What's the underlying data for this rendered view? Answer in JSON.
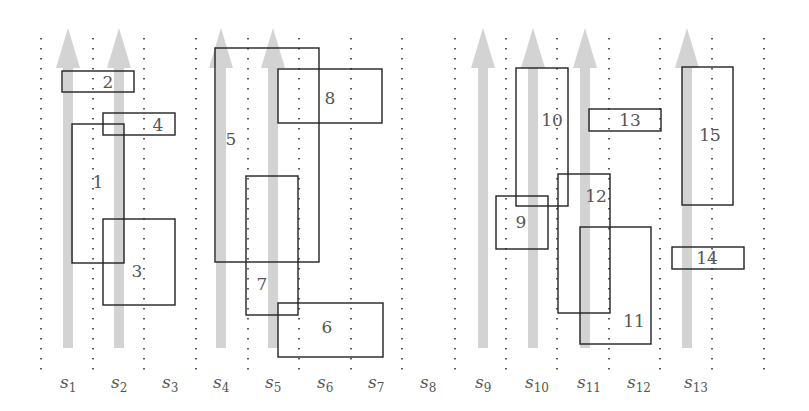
{
  "diagram": {
    "title": "",
    "slots": [
      {
        "id": "s1",
        "label": "s",
        "sub": "1",
        "label_x": 68
      },
      {
        "id": "s2",
        "label": "s",
        "sub": "2",
        "label_x": 119
      },
      {
        "id": "s3",
        "label": "s",
        "sub": "3",
        "label_x": 170
      },
      {
        "id": "s4",
        "label": "s",
        "sub": "4",
        "label_x": 221
      },
      {
        "id": "s5",
        "label": "s",
        "sub": "5",
        "label_x": 273
      },
      {
        "id": "s6",
        "label": "s",
        "sub": "6",
        "label_x": 325
      },
      {
        "id": "s7",
        "label": "s",
        "sub": "7",
        "label_x": 376
      },
      {
        "id": "s8",
        "label": "s",
        "sub": "8",
        "label_x": 428
      },
      {
        "id": "s9",
        "label": "s",
        "sub": "9",
        "label_x": 483
      },
      {
        "id": "s10",
        "label": "s",
        "sub": "10",
        "label_x": 533
      },
      {
        "id": "s11",
        "label": "s",
        "sub": "11",
        "label_x": 585
      },
      {
        "id": "s12",
        "label": "s",
        "sub": "12",
        "label_x": 635
      },
      {
        "id": "s13",
        "label": "s",
        "sub": "13",
        "label_x": 692
      }
    ],
    "dotted_lines_x": [
      41,
      93,
      144,
      196,
      248,
      299,
      351,
      402,
      455,
      506,
      557,
      609,
      660,
      712,
      764
    ],
    "arrows": [
      {
        "x": 68
      },
      {
        "x": 119
      },
      {
        "x": 221
      },
      {
        "x": 273
      },
      {
        "x": 483
      },
      {
        "x": 533
      },
      {
        "x": 585
      },
      {
        "x": 687
      }
    ],
    "rectangles": [
      {
        "label": "1",
        "x": 72,
        "y": 124,
        "w": 52,
        "h": 139,
        "lx": 98,
        "ly": 188
      },
      {
        "label": "2",
        "x": 62,
        "y": 71,
        "w": 72,
        "h": 21,
        "lx": 108,
        "ly": 88
      },
      {
        "label": "3",
        "x": 103,
        "y": 219,
        "w": 72,
        "h": 86,
        "lx": 137,
        "ly": 277
      },
      {
        "label": "4",
        "x": 103,
        "y": 113,
        "w": 72,
        "h": 22,
        "lx": 158,
        "ly": 131
      },
      {
        "label": "5",
        "x": 215,
        "y": 48,
        "w": 104,
        "h": 214,
        "lx": 231,
        "ly": 145
      },
      {
        "label": "6",
        "x": 278,
        "y": 303,
        "w": 105,
        "h": 54,
        "lx": 327,
        "ly": 333
      },
      {
        "label": "7",
        "x": 246,
        "y": 176,
        "w": 52,
        "h": 139,
        "lx": 262,
        "ly": 290
      },
      {
        "label": "8",
        "x": 278,
        "y": 69,
        "w": 104,
        "h": 54,
        "lx": 330,
        "ly": 104
      },
      {
        "label": "9",
        "x": 496,
        "y": 196,
        "w": 52,
        "h": 53,
        "lx": 521,
        "ly": 228
      },
      {
        "label": "10",
        "x": 516,
        "y": 68,
        "w": 52,
        "h": 138,
        "lx": 552,
        "ly": 126
      },
      {
        "label": "11",
        "x": 580,
        "y": 227,
        "w": 71,
        "h": 117,
        "lx": 634,
        "ly": 327
      },
      {
        "label": "12",
        "x": 558,
        "y": 174,
        "w": 52,
        "h": 139,
        "lx": 596,
        "ly": 202
      },
      {
        "label": "13",
        "x": 589,
        "y": 109,
        "w": 72,
        "h": 22,
        "lx": 630,
        "ly": 126
      },
      {
        "label": "14",
        "x": 672,
        "y": 247,
        "w": 72,
        "h": 22,
        "lx": 707,
        "ly": 264
      },
      {
        "label": "15",
        "x": 682,
        "y": 67,
        "w": 51,
        "h": 138,
        "lx": 710,
        "ly": 141
      }
    ],
    "colors": {
      "arrow": "#d3d3d3",
      "rect_stroke": "#222222",
      "dots": "#333333",
      "text": "#555555"
    }
  }
}
